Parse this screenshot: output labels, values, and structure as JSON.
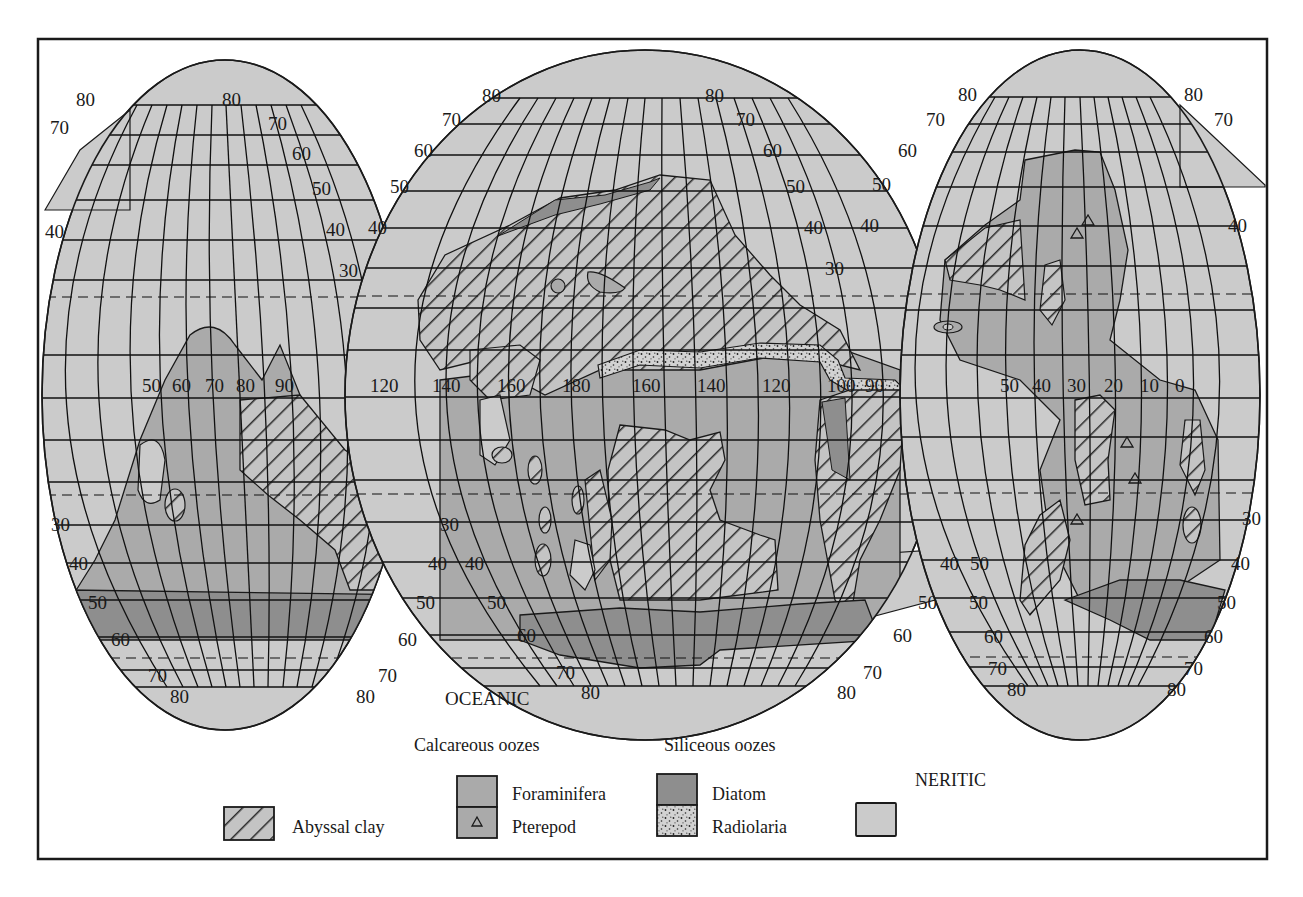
{
  "figure": {
    "region_label": "OCEANIC",
    "neritic_label": "NERITIC",
    "colors": {
      "neritic": "#cbcbcb",
      "foraminifera": "#aaaaaa",
      "diatom": "#8e8e8e",
      "abyssal_clay_fill": "#c4c4c4",
      "hatch": "#2a2a2a",
      "grid": "#111111",
      "frame": "#1a1a1a"
    }
  },
  "legend": {
    "calcareous_heading": "Calcareous oozes",
    "siliceous_heading": "Siliceous oozes",
    "neritic_heading": "NERITIC",
    "items": [
      {
        "key": "abyssal_clay",
        "label": "Abyssal clay",
        "pattern": "hatch"
      },
      {
        "key": "foraminifera",
        "label": "Foraminifera",
        "pattern": "solid"
      },
      {
        "key": "pterepod",
        "label": "Pterepod",
        "pattern": "triangle-symbol"
      },
      {
        "key": "diatom",
        "label": "Diatom",
        "pattern": "solid-dark"
      },
      {
        "key": "radiolaria",
        "label": "Radiolaria",
        "pattern": "stipple"
      },
      {
        "key": "neritic",
        "label": "",
        "pattern": "solid-light"
      }
    ]
  },
  "lobes": {
    "left": {
      "lat_labels_left": [
        "80",
        "70",
        "40",
        "30",
        "40",
        "50",
        "60",
        "70",
        "80"
      ],
      "lat_labels_right": [
        "80",
        "70",
        "60",
        "50",
        "40",
        "30",
        "30",
        "40",
        "50",
        "60",
        "70",
        "80"
      ],
      "lon_labels": [
        "50",
        "60",
        "70",
        "80",
        "90",
        "120"
      ]
    },
    "center": {
      "lat_labels_left": [
        "80",
        "70",
        "60",
        "50",
        "40",
        "30",
        "40",
        "50",
        "60",
        "70",
        "80"
      ],
      "lat_labels_right": [
        "80",
        "70",
        "60",
        "50",
        "40",
        "30",
        "40",
        "50",
        "60",
        "70",
        "80"
      ],
      "lon_labels": [
        "140",
        "160",
        "180",
        "160",
        "140",
        "120",
        "100",
        "90"
      ]
    },
    "right": {
      "lat_labels_left": [
        "80",
        "70",
        "60",
        "50",
        "40",
        "40",
        "50",
        "60",
        "70",
        "80"
      ],
      "lat_labels_right": [
        "80",
        "70",
        "40",
        "30",
        "40",
        "50",
        "60",
        "70",
        "80"
      ],
      "lon_labels": [
        "50",
        "40",
        "30",
        "20",
        "10",
        "0"
      ]
    }
  }
}
